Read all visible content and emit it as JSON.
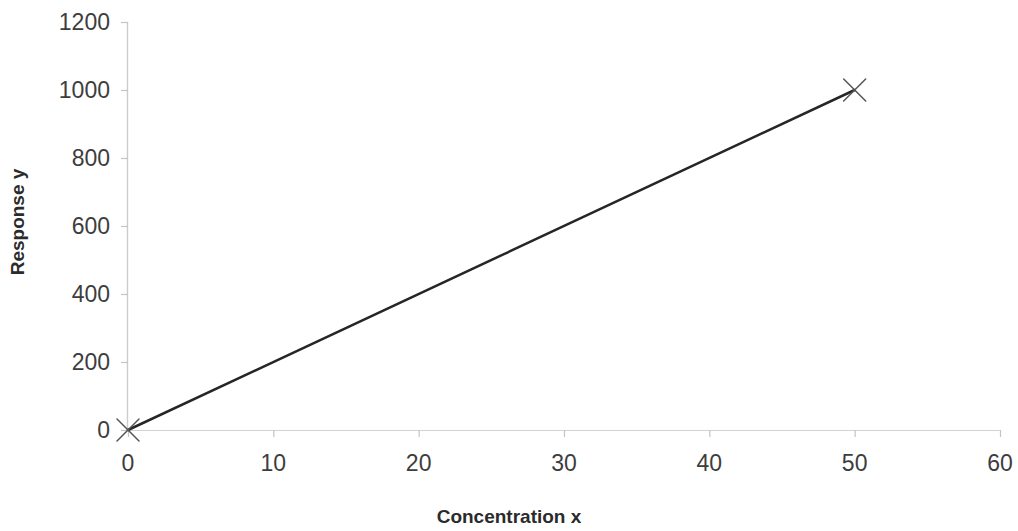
{
  "chart_data": {
    "type": "line",
    "title": "",
    "subtitle": "",
    "xlabel": "Concentration x",
    "ylabel": "Response y",
    "xlim": [
      0,
      60
    ],
    "ylim": [
      0,
      1200
    ],
    "xticks": [
      0,
      10,
      20,
      30,
      40,
      50,
      60
    ],
    "yticks": [
      0,
      200,
      400,
      600,
      800,
      1000,
      1200
    ],
    "xtick_labels": [
      "0",
      "10",
      "20",
      "30",
      "40",
      "50",
      "60"
    ],
    "ytick_labels": [
      "0",
      "200",
      "400",
      "600",
      "800",
      "1000",
      "1200"
    ],
    "grid": false,
    "legend": null,
    "marker": "x-cross",
    "series": [
      {
        "name": "Calibration line",
        "color": "#262626",
        "line_width": 2.5,
        "marker_color": "#555555",
        "x": [
          0,
          50
        ],
        "y": [
          0,
          1000
        ],
        "points": [
          {
            "x": 0,
            "y": 0
          },
          {
            "x": 50,
            "y": 1000
          }
        ]
      }
    ],
    "axis_color": "#c9c9c9",
    "tick_color": "#bdbdbd",
    "background": "#ffffff"
  },
  "geometry": {
    "plot_left_px": 128,
    "plot_right_px": 1000,
    "plot_bottom_px": 430,
    "plot_top_px": 22
  }
}
